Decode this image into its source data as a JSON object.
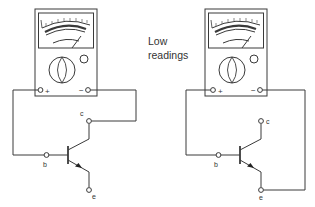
{
  "caption": {
    "line1": "Low",
    "line2": "readings"
  },
  "colors": {
    "stroke": "#3a3a3a",
    "text": "#333333",
    "background": "#ffffff"
  },
  "meters": [
    {
      "name": "left-meter",
      "terminal_positive": "+",
      "terminal_negative": "−",
      "connected_to": {
        "positive": "b",
        "negative": "c"
      }
    },
    {
      "name": "right-meter",
      "terminal_positive": "+",
      "terminal_negative": "−",
      "connected_to": {
        "positive": "b",
        "negative": "e"
      }
    }
  ],
  "transistors": [
    {
      "base": "b",
      "collector": "c",
      "emitter": "e"
    },
    {
      "base": "b",
      "collector": "c",
      "emitter": "e"
    }
  ]
}
